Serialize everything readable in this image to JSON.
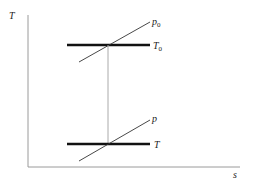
{
  "diagram": {
    "type": "T-s diagram",
    "axes": {
      "y_label": "T",
      "x_label": "s"
    },
    "isotherms": [
      {
        "id": "T0",
        "label": "T",
        "subscript": "0"
      },
      {
        "id": "T",
        "label": "T",
        "subscript": ""
      }
    ],
    "isobars": [
      {
        "id": "p0",
        "label": "p",
        "subscript": "0"
      },
      {
        "id": "p",
        "label": "p",
        "subscript": ""
      }
    ],
    "colors": {
      "axis": "#9a9a9a",
      "thick_line": "#111111",
      "thin_line": "#333333",
      "connector": "#a0a0a0"
    }
  }
}
